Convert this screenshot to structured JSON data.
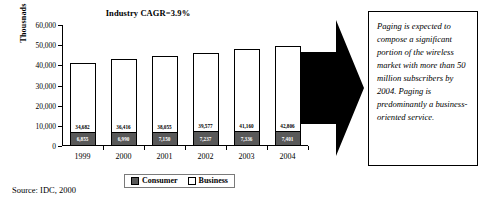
{
  "chart": {
    "title": "Industry CAGR=3.9%",
    "y_axis_title": "Thousnads",
    "source_note": "Source: IDC, 2000",
    "legend": {
      "consumer_label": "Consumer",
      "business_label": "Business"
    }
  },
  "callout": {
    "text": "Paging is expected to compose a significant portion of the wireless market with more than 50 million subscribers by 2004.  Paging is predominantly a business-oriented service."
  },
  "chart_data": {
    "type": "bar",
    "stacked": true,
    "title": "Industry CAGR=3.9%",
    "xlabel": "",
    "ylabel": "Thousnads",
    "ylim": [
      0,
      60000
    ],
    "ytick_labels": [
      "0",
      "10,000",
      "20,000",
      "30,000",
      "40,000",
      "50,000",
      "60,000"
    ],
    "ytick_values": [
      0,
      10000,
      20000,
      30000,
      40000,
      50000,
      60000
    ],
    "grid": false,
    "legend_position": "bottom",
    "categories": [
      "1999",
      "2000",
      "2001",
      "2002",
      "2003",
      "2004"
    ],
    "series": [
      {
        "name": "Consumer",
        "color": "#595959",
        "values": [
          6855,
          6990,
          7150,
          7237,
          7336,
          7401
        ],
        "labels": [
          "6,855",
          "6,990",
          "7,150",
          "7,237",
          "7,336",
          "7,401"
        ]
      },
      {
        "name": "Business",
        "color": "#FFFFFF",
        "values": [
          34682,
          36416,
          38055,
          39577,
          41160,
          42806
        ],
        "labels": [
          "34,682",
          "36,416",
          "38,055",
          "39,577",
          "41,160",
          "42,806"
        ]
      }
    ]
  }
}
